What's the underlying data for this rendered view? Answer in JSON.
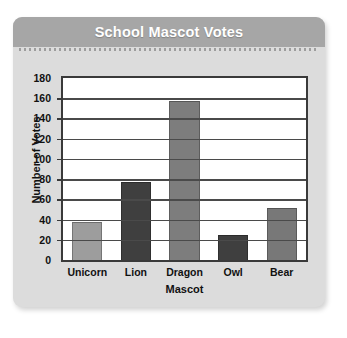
{
  "chart_data": {
    "type": "bar",
    "title": "School Mascot Votes",
    "categories": [
      "Unicorn",
      "Lion",
      "Dragon",
      "Owl",
      "Bear"
    ],
    "values": [
      38,
      77,
      157,
      25,
      51
    ],
    "xlabel": "Mascot",
    "ylabel": "Number of Votes",
    "ylim": [
      0,
      180
    ],
    "ytick_step": 20,
    "yticks": [
      0,
      20,
      40,
      60,
      80,
      100,
      120,
      140,
      160,
      180
    ],
    "ytick_labels": [
      "0",
      "20",
      "40",
      "60",
      "80",
      "100",
      "120",
      "140",
      "160",
      "180"
    ],
    "grid": true,
    "legend": null,
    "bar_colors": [
      "#9d9d9d",
      "#3f3f3f",
      "#7d7d7d",
      "#3f3f3f",
      "#787878"
    ]
  },
  "panel": {
    "background_color": "#dcdcdc",
    "title_bar_color": "#a6a6a6",
    "title_text_color": "#ffffff"
  }
}
